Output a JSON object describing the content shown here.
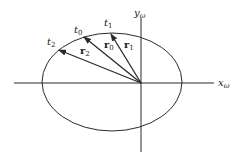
{
  "diagram": {
    "type": "orbit-ellipse-position-vectors",
    "colors": {
      "stroke": "#2a2a2a",
      "background": "#ffffff"
    },
    "axes": {
      "x": {
        "label_base": "x",
        "label_sub": "ω"
      },
      "y": {
        "label_base": "y",
        "label_sub": "ω"
      }
    },
    "time_labels": [
      {
        "base": "t",
        "sub": "2"
      },
      {
        "base": "t",
        "sub": "0"
      },
      {
        "base": "t",
        "sub": "1"
      }
    ],
    "vectors": [
      {
        "base": "r",
        "sub": "2"
      },
      {
        "base": "r",
        "sub": "0"
      },
      {
        "base": "r",
        "sub": "1"
      }
    ]
  }
}
